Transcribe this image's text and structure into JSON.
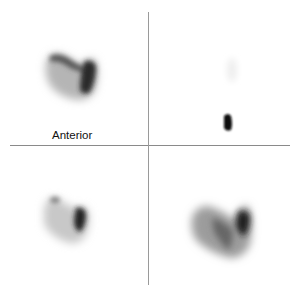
{
  "panels": [
    {
      "id": "top-left",
      "label": "Anterior",
      "content": "thyroid-scintigraphy-image"
    },
    {
      "id": "top-right",
      "label": "Anterior Marker 128 x 128",
      "content": "marker-image-with-hot-spot"
    },
    {
      "id": "bottom-left",
      "label": "",
      "content": "thyroid-scintigraphy-image"
    },
    {
      "id": "bottom-right",
      "label": "",
      "content": "thyroid-scintigraphy-image"
    }
  ],
  "colors": {
    "background": "#ffffff",
    "divider": "#8a8a8a",
    "uptake_dark": "#111111"
  }
}
